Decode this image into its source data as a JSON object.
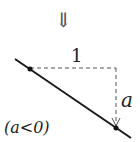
{
  "arrow_symbol": "⇓",
  "run_label": "1",
  "rise_label": "a",
  "condition_label": "(a<0)",
  "colors": {
    "line": "#1a1a1a",
    "dash": "#555555"
  }
}
